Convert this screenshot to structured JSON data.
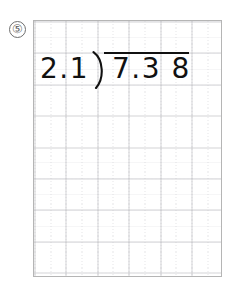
{
  "worksheet": {
    "problem_number": "⑤",
    "problem_number_icon": "circled-number-five"
  },
  "division": {
    "divisor": "2.1",
    "dividend": "7.3 8",
    "dividend_digits": [
      "7",
      ".",
      "3",
      "8"
    ],
    "bracket_glyph": ")",
    "expression": "2.1 ) 7.38",
    "quotient": ""
  },
  "paper": {
    "type": "grid-paper",
    "grid_columns": 6,
    "grid_rows": 8,
    "border_color": "#b5b5b5",
    "grid_color": "#b0b0b4",
    "background_color": "#ffffff",
    "ink_color": "#111111"
  }
}
